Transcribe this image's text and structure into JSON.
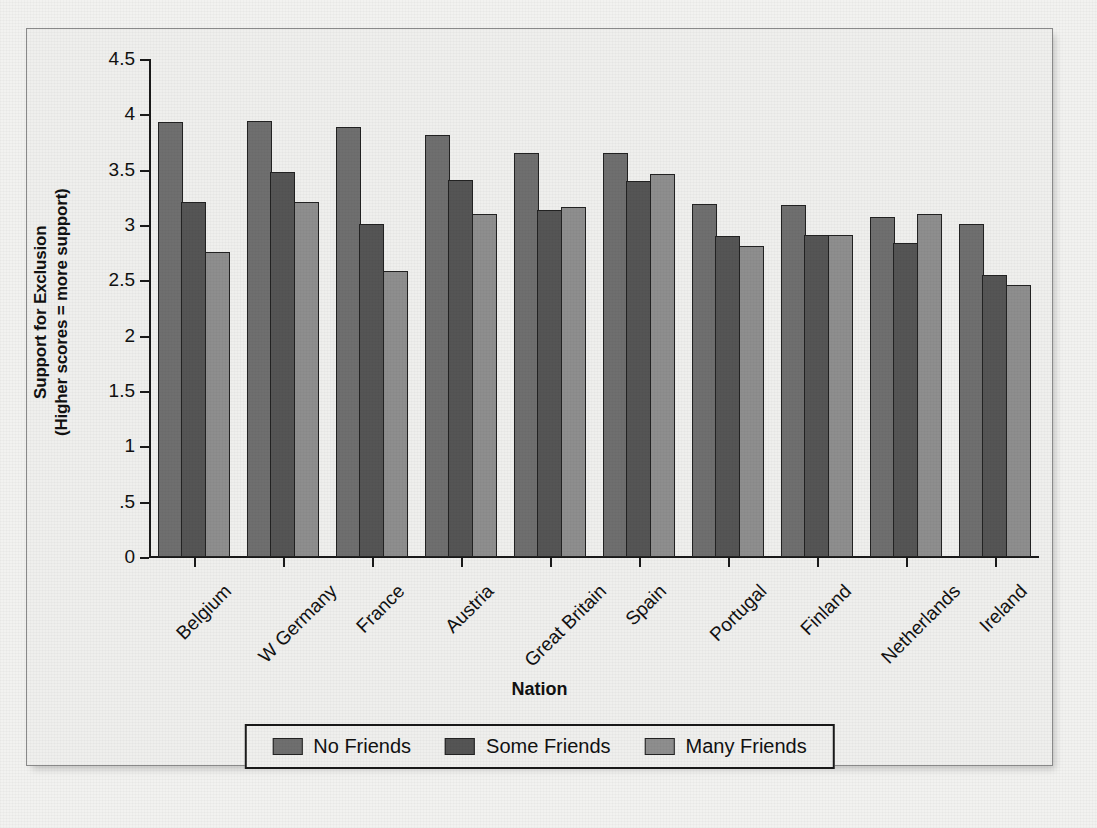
{
  "chart_data": {
    "type": "bar",
    "title": "",
    "xlabel": "Nation",
    "ylabel": "Support for Exclusion (Higher scores = more support)",
    "ylabel_line1": "Support for Exclusion",
    "ylabel_line2": "(Higher scores = more support)",
    "ylim": [
      0,
      4.5
    ],
    "ytick_values": [
      0,
      0.5,
      1,
      1.5,
      2,
      2.5,
      3,
      3.5,
      4,
      4.5
    ],
    "ytick_labels": [
      "0",
      ".5",
      "1",
      "1.5",
      "2",
      "2.5",
      "3",
      "3.5",
      "4",
      "4.5"
    ],
    "grid": false,
    "legend_position": "bottom-center",
    "categories": [
      "Belgium",
      "W Germany",
      "France",
      "Austria",
      "Great Britain",
      "Spain",
      "Portugal",
      "Finland",
      "Netherlands",
      "Ireland"
    ],
    "series": [
      {
        "name": "No Friends",
        "color": "#6f6f6f",
        "values": [
          3.93,
          3.94,
          3.89,
          3.81,
          3.65,
          3.65,
          3.19,
          3.18,
          3.07,
          3.01
        ]
      },
      {
        "name": "Some Friends",
        "color": "#555555",
        "values": [
          3.21,
          3.48,
          3.01,
          3.41,
          3.14,
          3.4,
          2.9,
          2.91,
          2.84,
          2.55
        ]
      },
      {
        "name": "Many Friends",
        "color": "#8e8e8e",
        "values": [
          2.76,
          3.21,
          2.58,
          3.1,
          3.16,
          3.46,
          2.81,
          2.91,
          3.1,
          2.46
        ]
      }
    ]
  }
}
